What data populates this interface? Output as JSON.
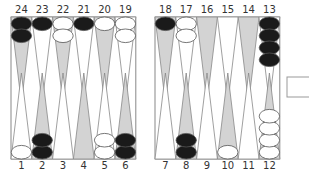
{
  "board": {
    "colors": {
      "light_point": "#ffffff",
      "dark_point": "#d3d3d3",
      "point_stroke": "#888888",
      "frame": "#888888",
      "black_checker": "#1a1a1a",
      "white_checker": "#ffffff",
      "checker_stroke": "#555555"
    },
    "top_points": [
      {
        "label": "24",
        "shade": "dark",
        "checkers": {
          "color": "black",
          "count": 2
        }
      },
      {
        "label": "23",
        "shade": "light",
        "checkers": {
          "color": "black",
          "count": 1
        }
      },
      {
        "label": "22",
        "shade": "dark",
        "checkers": {
          "color": "white",
          "count": 2
        }
      },
      {
        "label": "21",
        "shade": "light",
        "checkers": {
          "color": "black",
          "count": 1
        }
      },
      {
        "label": "20",
        "shade": "dark",
        "checkers": {
          "color": "white",
          "count": 1
        }
      },
      {
        "label": "19",
        "shade": "light",
        "checkers": {
          "color": "white",
          "count": 2
        }
      },
      {
        "label": "18",
        "shade": "dark",
        "checkers": {
          "color": "black",
          "count": 1
        }
      },
      {
        "label": "17",
        "shade": "light",
        "checkers": {
          "color": "white",
          "count": 2
        }
      },
      {
        "label": "16",
        "shade": "dark",
        "checkers": {
          "color": "none",
          "count": 0
        }
      },
      {
        "label": "15",
        "shade": "light",
        "checkers": {
          "color": "none",
          "count": 0
        }
      },
      {
        "label": "14",
        "shade": "dark",
        "checkers": {
          "color": "none",
          "count": 0
        }
      },
      {
        "label": "13",
        "shade": "light",
        "checkers": {
          "color": "black",
          "count": 4
        }
      }
    ],
    "bottom_points": [
      {
        "label": "1",
        "shade": "light",
        "checkers": {
          "color": "white",
          "count": 1
        }
      },
      {
        "label": "2",
        "shade": "dark",
        "checkers": {
          "color": "black",
          "count": 2
        }
      },
      {
        "label": "3",
        "shade": "light",
        "checkers": {
          "color": "none",
          "count": 0
        }
      },
      {
        "label": "4",
        "shade": "dark",
        "checkers": {
          "color": "none",
          "count": 0
        }
      },
      {
        "label": "5",
        "shade": "light",
        "checkers": {
          "color": "white",
          "count": 2
        }
      },
      {
        "label": "6",
        "shade": "dark",
        "checkers": {
          "color": "black",
          "count": 2
        }
      },
      {
        "label": "7",
        "shade": "light",
        "checkers": {
          "color": "none",
          "count": 0
        }
      },
      {
        "label": "8",
        "shade": "dark",
        "checkers": {
          "color": "black",
          "count": 2
        }
      },
      {
        "label": "9",
        "shade": "light",
        "checkers": {
          "color": "none",
          "count": 0
        }
      },
      {
        "label": "10",
        "shade": "dark",
        "checkers": {
          "color": "white",
          "count": 1
        }
      },
      {
        "label": "11",
        "shade": "light",
        "checkers": {
          "color": "none",
          "count": 0
        }
      },
      {
        "label": "12",
        "shade": "dark",
        "checkers": {
          "color": "white",
          "count": 4
        }
      }
    ],
    "cube": {
      "value": ""
    }
  }
}
